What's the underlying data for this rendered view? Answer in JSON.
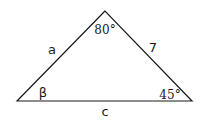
{
  "diagram": {
    "type": "triangle",
    "vertices": {
      "top": {
        "x": 105,
        "y": 11
      },
      "left": {
        "x": 17,
        "y": 101
      },
      "right": {
        "x": 192,
        "y": 101
      }
    },
    "sides": {
      "left_side": {
        "label": "a"
      },
      "right_side": {
        "label": "7"
      },
      "base": {
        "label": "c"
      }
    },
    "angles": {
      "top": {
        "label": "80°"
      },
      "left": {
        "label": "β"
      },
      "right": {
        "label": "45°"
      }
    },
    "stroke_color": "#1a1a1a",
    "background": "#ffffff"
  }
}
